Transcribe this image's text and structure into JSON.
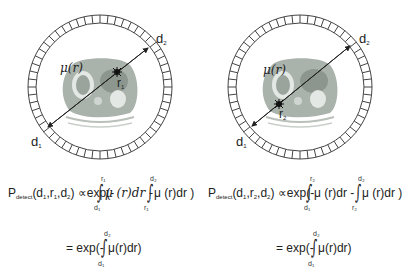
{
  "panels": [
    {
      "id": "left",
      "ring_center": [
        100,
        87
      ],
      "labels": {
        "d1": "d",
        "d1_sub": "1",
        "d2": "d",
        "d2_sub": "2",
        "mu": "μ(r)",
        "point": "r",
        "point_sub": "1"
      },
      "equation": {
        "lhs": "P",
        "lhs_sub": "detect",
        "args": "(d",
        "args_1": "1",
        "args_mid": ",r",
        "args_2": "1",
        "args_mid2": ",d",
        "args_3": "2",
        "args_close": ")",
        "prop": "∝",
        "exp_open": "exp(-",
        "integral1_upper": "r₁",
        "integral1_lower": "d₁",
        "term1": "μ (r)dr -",
        "integral2_upper": "d₂",
        "integral2_lower": "r₁",
        "term2": "μ (r)dr )",
        "eq2_prefix": "= exp(-",
        "eq2_upper": "d₂",
        "eq2_lower": "d₁",
        "eq2_term": "μ(r)dr)"
      }
    },
    {
      "id": "right",
      "ring_center": [
        300,
        87
      ],
      "labels": {
        "d1": "d",
        "d1_sub": "1",
        "d2": "d",
        "d2_sub": "2",
        "mu": "μ(r)",
        "point": "r",
        "point_sub": "2"
      },
      "equation": {
        "lhs": "P",
        "lhs_sub": "detect",
        "args": "(d",
        "args_1": "1",
        "args_mid": ",r",
        "args_2": "2",
        "args_mid2": ",d",
        "args_3": "2",
        "args_close": ")",
        "prop": "∝",
        "exp_open": "exp(-",
        "integral1_upper": "r₂",
        "integral1_lower": "d₁",
        "term1": "μ (r)dr -",
        "integral2_upper": "d₂",
        "integral2_lower": "r₂",
        "term2": "μ (r)dr )",
        "eq2_prefix": "= exp(-",
        "eq2_upper": "d₂",
        "eq2_lower": "d₁",
        "eq2_term": "μ(r)dr)"
      }
    }
  ],
  "colors": {
    "line": "#222222",
    "ring": "#444444",
    "tissue": "#a9b2ab",
    "organ": "#8c968f",
    "lung": "#e4e8e4"
  }
}
